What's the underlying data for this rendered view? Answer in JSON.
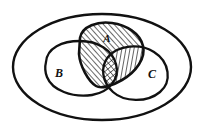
{
  "figure": {
    "type": "venn-diagram",
    "title": "",
    "universe_shape": "ellipse",
    "set_count": 3,
    "stroke_color": "#111111",
    "background_color": "#ffffff",
    "hatch_color": "#111111"
  },
  "labels": {
    "a": "A",
    "b": "B",
    "c": "C"
  },
  "sets": [
    {
      "id": "a",
      "label": "A",
      "position": "top-center",
      "label_x": 107,
      "label_y": 41,
      "shaded": true,
      "shade_pattern": "hatch"
    },
    {
      "id": "b",
      "label": "B",
      "position": "left",
      "label_x": 59,
      "label_y": 76,
      "shaded": false,
      "shade_pattern": "none"
    },
    {
      "id": "c",
      "label": "C",
      "position": "right",
      "label_x": 152,
      "label_y": 77,
      "shaded": false,
      "shade_pattern": "none"
    }
  ],
  "regions": [
    {
      "id": "a-only",
      "description": "A only",
      "pattern": "diagonal-hatch-right",
      "shaded": true
    },
    {
      "id": "a-and-b",
      "description": "A intersect B",
      "pattern": "diagonal-hatch-right",
      "shaded": true
    },
    {
      "id": "a-and-c",
      "description": "A intersect C",
      "pattern": "vertical-hatch",
      "shaded": true
    },
    {
      "id": "a-and-b-and-c",
      "description": "A intersect B intersect C",
      "pattern": "cross-hatch",
      "shaded": true
    },
    {
      "id": "b-only",
      "description": "B only",
      "pattern": "none",
      "shaded": false
    },
    {
      "id": "c-only",
      "description": "C only",
      "pattern": "none",
      "shaded": false
    },
    {
      "id": "b-and-c",
      "description": "B intersect C outside A",
      "pattern": "none",
      "shaded": false
    },
    {
      "id": "universe-outside",
      "description": "Universe outside all sets",
      "pattern": "none",
      "shaded": false
    }
  ]
}
